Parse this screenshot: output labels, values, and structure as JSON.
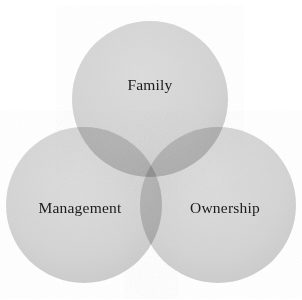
{
  "diagram": {
    "type": "venn-3-circle",
    "background_color": "#ffffff",
    "canvas": {
      "width": 302,
      "height": 300
    },
    "circle_fill_color": "#d4d4d4",
    "overlap_fill_color": "#b9b9b9",
    "center_overlap_color": "#a8a8a8",
    "label_color": "#1b1b1b",
    "circles": [
      {
        "id": "family",
        "label": "Family",
        "cx": 150,
        "cy": 99,
        "r": 78,
        "label_x": 150,
        "label_y": 86
      },
      {
        "id": "management",
        "label": "Management",
        "cx": 84,
        "cy": 205,
        "r": 78,
        "label_x": 80,
        "label_y": 209
      },
      {
        "id": "ownership",
        "label": "Ownership",
        "cx": 218,
        "cy": 205,
        "r": 78,
        "label_x": 225,
        "label_y": 209
      }
    ]
  }
}
